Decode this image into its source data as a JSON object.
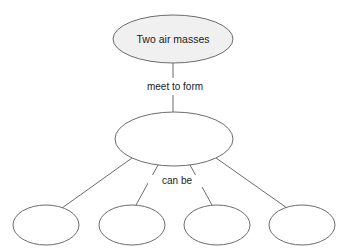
{
  "diagram": {
    "background_color": "#ffffff",
    "stroke_color": "#6b6b6b",
    "text_color": "#1a1a1a",
    "nodes": {
      "top": {
        "id": "node-top",
        "label": "Two air masses",
        "fill": "#f0f0f0",
        "filled": true
      },
      "middle": {
        "id": "node-middle",
        "label": "",
        "fill": "#ffffff",
        "filled": false
      },
      "bottom": [
        {
          "id": "node-bottom-1",
          "label": "",
          "fill": "#ffffff",
          "filled": false
        },
        {
          "id": "node-bottom-2",
          "label": "",
          "fill": "#ffffff",
          "filled": false
        },
        {
          "id": "node-bottom-3",
          "label": "",
          "fill": "#ffffff",
          "filled": false
        },
        {
          "id": "node-bottom-4",
          "label": "",
          "fill": "#ffffff",
          "filled": false
        }
      ]
    },
    "edge_labels": {
      "top_to_middle": "meet to form",
      "middle_to_bottom": "can be"
    }
  }
}
